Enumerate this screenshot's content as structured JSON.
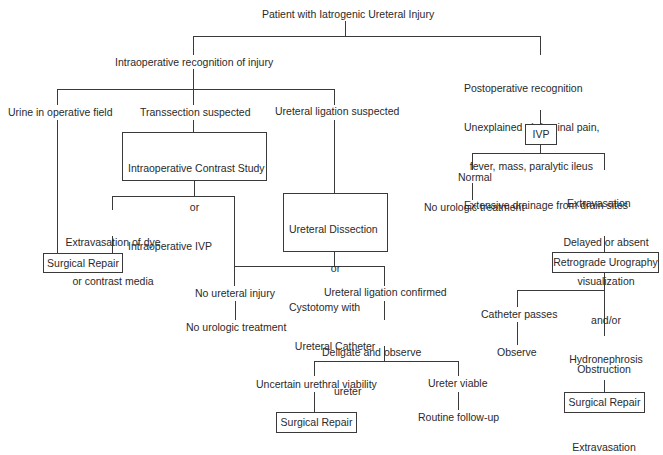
{
  "diagram": {
    "type": "flowchart",
    "colors": {
      "line": "#3a3a3a",
      "text": "#2a2a2a",
      "background": "#ffffff"
    },
    "nodes": {
      "root": {
        "text": "Patient with Iatrogenic Ureteral Injury"
      },
      "intraop": {
        "text": "Intraoperative recognition of injury"
      },
      "postop": {
        "lines": [
          "Postoperative recognition",
          "Unexplained abdominal pain,",
          "  fever, mass, paralytic ileus",
          "Extensive drainage from drain sites"
        ]
      },
      "urine": {
        "text": "Urine in operative field"
      },
      "transsection": {
        "text": "Transsection suspected"
      },
      "ligation_suspected": {
        "text": "Ureteral ligation suspected"
      },
      "contrast_study": {
        "lines": [
          "Intraoperative Contrast Study",
          "or",
          "Intraoperative IVP"
        ]
      },
      "ureteral_dissection": {
        "lines": [
          "Ureteral Dissection",
          "or",
          "Cystotomy with",
          "  Ureteral Catheter"
        ]
      },
      "extravasation_dye": {
        "lines": [
          "Extravasation of dye",
          "or contrast media"
        ]
      },
      "surgical_repair_1": {
        "text": "Surgical Repair"
      },
      "no_ureteral_injury": {
        "text": "No ureteral injury"
      },
      "no_urologic_treatment_1": {
        "text": "No urologic treatment"
      },
      "ligation_confirmed": {
        "text": "Ureteral ligation confirmed"
      },
      "deligate": {
        "lines": [
          "Deligate and observe",
          "ureter"
        ]
      },
      "uncertain_viability": {
        "text": "Uncertain urethral viability"
      },
      "surgical_repair_2": {
        "text": "Surgical Repair"
      },
      "ureter_viable": {
        "text": "Ureter viable"
      },
      "routine_followup": {
        "text": "Routine follow-up"
      },
      "ivp": {
        "text": "IVP"
      },
      "normal": {
        "text": "Normal"
      },
      "no_urologic_treatment_2": {
        "text": "No urologic treatment"
      },
      "extravasation_delayed": {
        "lines": [
          "Extravasation",
          "Delayed or absent",
          "visualization",
          "and/or",
          "Hydronephrosis"
        ]
      },
      "retrograde_urography": {
        "text": "Retrograde Urography"
      },
      "catheter_passes": {
        "text": "Catheter passes"
      },
      "observe": {
        "text": "Observe"
      },
      "obstruction": {
        "lines": [
          "Obstruction",
          "or",
          "Extravasation"
        ]
      },
      "surgical_repair_3": {
        "text": "Surgical Repair"
      }
    }
  }
}
